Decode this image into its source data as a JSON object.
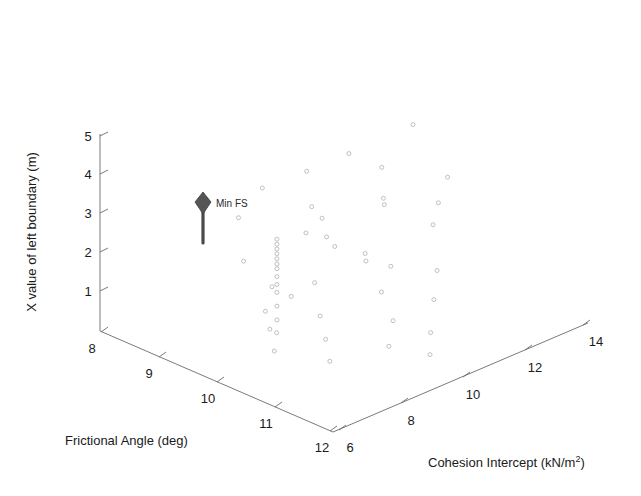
{
  "figure": {
    "background_color": "#ffffff",
    "width": 641,
    "height": 496
  },
  "chart_data": {
    "type": "scatter",
    "projection": "3d",
    "title": "",
    "xlabel": "Frictional Angle (deg)",
    "ylabel": "Cohesion Intercept (kN/m²)",
    "zlabel": "X value of left boundary (m)",
    "xticks": [
      8,
      9,
      10,
      11,
      12
    ],
    "yticks": [
      6,
      8,
      10,
      12,
      14
    ],
    "zticks": [
      1,
      2,
      3,
      4,
      5
    ],
    "xlim": [
      7.5,
      12.5
    ],
    "ylim": [
      5,
      15
    ],
    "zlim": [
      0.5,
      5.5
    ],
    "grid": false,
    "legend": false,
    "marker": "open-circle",
    "marker_color": "#b9b9b9",
    "marker_size": 4,
    "annotations": [
      {
        "label": "Min FS",
        "marker": "pin-diamond",
        "color": "#555555",
        "x": 9.6,
        "y": 8.1,
        "z": 3.1
      }
    ],
    "points": [
      {
        "x": 9.6,
        "y": 8.1,
        "z": 3.05
      },
      {
        "x": 9.6,
        "y": 8.1,
        "z": 2.92
      },
      {
        "x": 9.6,
        "y": 8.1,
        "z": 2.8
      },
      {
        "x": 9.6,
        "y": 8.1,
        "z": 2.68
      },
      {
        "x": 9.6,
        "y": 8.1,
        "z": 2.55
      },
      {
        "x": 9.6,
        "y": 8.1,
        "z": 2.42
      },
      {
        "x": 9.6,
        "y": 8.1,
        "z": 2.3
      },
      {
        "x": 9.6,
        "y": 8.1,
        "z": 2.1
      },
      {
        "x": 9.6,
        "y": 8.1,
        "z": 1.9
      },
      {
        "x": 9.6,
        "y": 8.1,
        "z": 1.7
      },
      {
        "x": 9.6,
        "y": 8.1,
        "z": 1.35
      },
      {
        "x": 9.6,
        "y": 8.1,
        "z": 1.0
      },
      {
        "x": 9.62,
        "y": 8.05,
        "z": 0.7
      },
      {
        "x": 10.55,
        "y": 11.7,
        "z": 5.45
      },
      {
        "x": 10.05,
        "y": 10.1,
        "z": 4.9
      },
      {
        "x": 10.4,
        "y": 10.75,
        "z": 4.55
      },
      {
        "x": 11.1,
        "y": 12.05,
        "z": 4.3
      },
      {
        "x": 10.6,
        "y": 10.45,
        "z": 3.95
      },
      {
        "x": 10.62,
        "y": 10.45,
        "z": 3.8
      },
      {
        "x": 11.15,
        "y": 11.6,
        "z": 3.8
      },
      {
        "x": 10.05,
        "y": 9.05,
        "z": 3.55
      },
      {
        "x": 11.2,
        "y": 11.3,
        "z": 3.35
      },
      {
        "x": 9.95,
        "y": 8.6,
        "z": 3.25
      },
      {
        "x": 10.2,
        "y": 8.95,
        "z": 3.18
      },
      {
        "x": 10.35,
        "y": 9.0,
        "z": 3.0
      },
      {
        "x": 10.7,
        "y": 9.55,
        "z": 2.85
      },
      {
        "x": 10.8,
        "y": 9.4,
        "z": 2.75
      },
      {
        "x": 9.35,
        "y": 7.25,
        "z": 2.6
      },
      {
        "x": 10.95,
        "y": 10.1,
        "z": 2.5
      },
      {
        "x": 11.45,
        "y": 11.0,
        "z": 2.4
      },
      {
        "x": 10.3,
        "y": 8.3,
        "z": 2.25
      },
      {
        "x": 9.85,
        "y": 7.45,
        "z": 2.15
      },
      {
        "x": 11.05,
        "y": 9.55,
        "z": 2.05
      },
      {
        "x": 10.1,
        "y": 7.75,
        "z": 1.95
      },
      {
        "x": 11.6,
        "y": 10.6,
        "z": 1.85
      },
      {
        "x": 9.9,
        "y": 7.1,
        "z": 1.65
      },
      {
        "x": 10.5,
        "y": 8.15,
        "z": 1.55
      },
      {
        "x": 11.3,
        "y": 9.55,
        "z": 1.45
      },
      {
        "x": 10.05,
        "y": 7.0,
        "z": 1.3
      },
      {
        "x": 11.75,
        "y": 10.2,
        "z": 1.2
      },
      {
        "x": 10.7,
        "y": 8.0,
        "z": 1.1
      },
      {
        "x": 11.4,
        "y": 9.2,
        "z": 0.95
      },
      {
        "x": 10.2,
        "y": 6.9,
        "z": 0.85
      },
      {
        "x": 11.9,
        "y": 9.9,
        "z": 0.8
      },
      {
        "x": 10.9,
        "y": 7.8,
        "z": 0.7
      },
      {
        "x": 9.5,
        "y": 9.45,
        "z": 4.35
      },
      {
        "x": 9.15,
        "y": 8.35,
        "z": 4.05
      },
      {
        "x": 9.8,
        "y": 9.1,
        "z": 3.7
      },
      {
        "x": 9.05,
        "y": 7.6,
        "z": 3.45
      }
    ]
  },
  "axes": {
    "z_axis": {
      "name": "X value of left boundary (m)",
      "ticks": [
        "1",
        "2",
        "3",
        "4",
        "5"
      ]
    },
    "x_axis": {
      "name": "Frictional Angle (deg)",
      "ticks": [
        "8",
        "9",
        "10",
        "11",
        "12"
      ]
    },
    "y_axis": {
      "name_main": "Cohesion Intercept (kN/m",
      "name_sup": "2",
      "name_tail": ")",
      "ticks": [
        "6",
        "8",
        "10",
        "12",
        "14"
      ]
    }
  },
  "annotation": {
    "min_fs_label": "Min FS"
  }
}
